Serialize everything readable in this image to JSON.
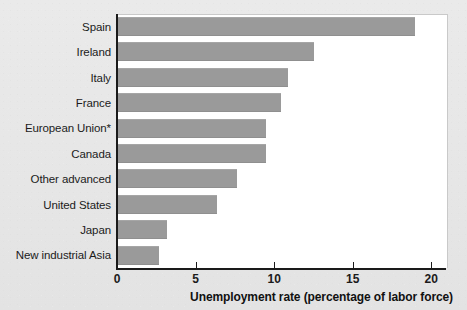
{
  "chart_data": {
    "type": "bar",
    "orientation": "horizontal",
    "title": "",
    "subtitle": "",
    "xlabel": "Unemployment rate (percentage of labor force)",
    "ylabel": "",
    "xlim": [
      0,
      21
    ],
    "xticks": [
      0,
      5,
      10,
      15,
      20
    ],
    "xtick_labels": [
      "0",
      "5",
      "10",
      "15",
      "20"
    ],
    "grid": false,
    "legend": null,
    "bar_color": "#9a9a9a",
    "plot_background": "#ffffff",
    "figure_background": "#e7e7e7",
    "axis_color": "#1a1a1a",
    "categories": [
      "Spain",
      "Ireland",
      "Italy",
      "France",
      "European Union*",
      "Canada",
      "Other advanced",
      "United States",
      "Japan",
      "New industrial Asia"
    ],
    "values": [
      18.9,
      12.5,
      10.8,
      10.4,
      9.4,
      9.4,
      7.6,
      6.3,
      3.1,
      2.6
    ],
    "annotations": [
      "* asterisk marks European Union aggregate"
    ]
  }
}
